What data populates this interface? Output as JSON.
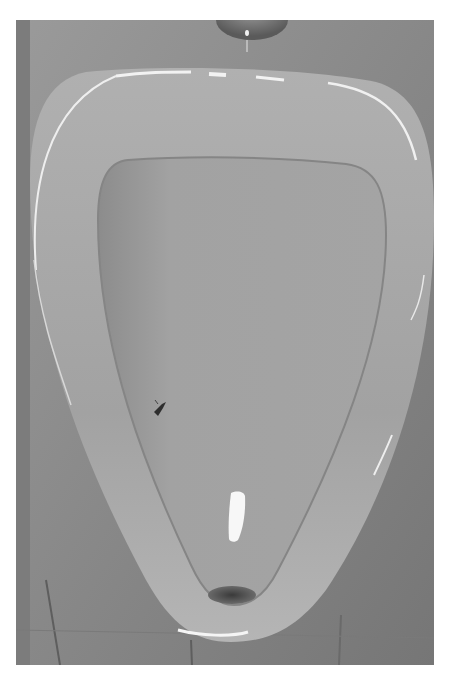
{
  "image": {
    "subject": "Urinal with etched fly target",
    "tone": "grayscale",
    "elements": {
      "flush_outlet": "flush-outlet-icon",
      "bowl": "urinal-bowl",
      "fly": "fly-icon",
      "drain": "drain-icon",
      "reflection": "light-reflection",
      "wall_tiles": "tile-wall"
    },
    "colors": {
      "border": "#ffffff",
      "wall": "#858585",
      "rim": "#a6a6a6",
      "basin": "#9c9c9c",
      "drain": "#4a4a4a",
      "highlight": "#f5f5f5"
    }
  }
}
